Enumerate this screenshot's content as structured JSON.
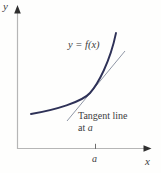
{
  "figure": {
    "axis_labels": {
      "y": "y",
      "x": "x"
    },
    "curve_label": "y = f(x)",
    "annotation": {
      "line1": "Tangent line",
      "line2_prefix": "at ",
      "point": "a"
    },
    "x_tick_label": "a",
    "colors": {
      "background": "#fefefd",
      "curve": "#2e3157",
      "tangent_line": "#9097a6",
      "axis": "#b6b6b6",
      "arrow": "#2f2f2f",
      "tick": "#6e6e6e",
      "text": "#3d3d3d"
    }
  }
}
